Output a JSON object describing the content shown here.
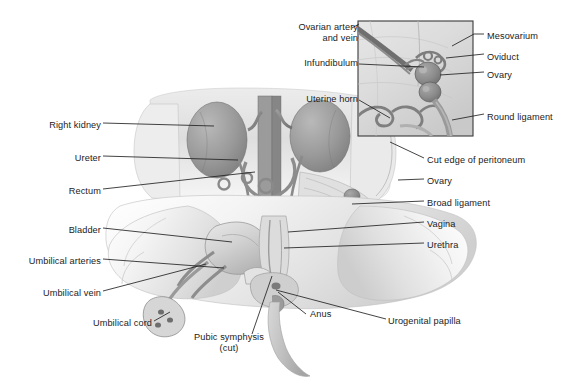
{
  "figure": {
    "background_color": "#ffffff",
    "text_color": "#1b1b1b",
    "leader_line_color": "#222222"
  },
  "inset": {
    "name": "ovary-detail-inset",
    "border_color": "#3a3a3a",
    "x": 358,
    "y": 21,
    "width": 115,
    "height": 115,
    "labels_left": [
      {
        "id": "ovarian-artery-and-vein",
        "line1": "Ovarian artery",
        "line2": "and vein",
        "x": 288,
        "y": 22,
        "width": 70
      },
      {
        "id": "infundibulum",
        "text": "Infundibulum",
        "x": 283,
        "y": 58,
        "width": 75
      },
      {
        "id": "uterine-horn",
        "text": "Uterine horn",
        "x": 287,
        "y": 94,
        "width": 71
      }
    ],
    "labels_right": [
      {
        "id": "mesovarium",
        "text": "Mesovarium",
        "x": 487,
        "y": 31
      },
      {
        "id": "oviduct",
        "text": "Oviduct",
        "x": 487,
        "y": 52
      },
      {
        "id": "ovary-inset",
        "text": "Ovary",
        "x": 487,
        "y": 70
      },
      {
        "id": "round-ligament",
        "text": "Round ligament",
        "x": 487,
        "y": 112
      }
    ]
  },
  "labels_left": [
    {
      "id": "right-kidney",
      "text": "Right kidney",
      "x": 35,
      "y": 120,
      "width": 66
    },
    {
      "id": "ureter",
      "text": "Ureter",
      "x": 60,
      "y": 153,
      "width": 41
    },
    {
      "id": "rectum",
      "text": "Rectum",
      "x": 56,
      "y": 186,
      "width": 45
    },
    {
      "id": "bladder",
      "text": "Bladder",
      "x": 57,
      "y": 225,
      "width": 44
    },
    {
      "id": "umbilical-arteries",
      "text": "Umbilical arteries",
      "x": 13,
      "y": 256,
      "width": 88
    },
    {
      "id": "umbilical-vein",
      "text": "Umbilical vein",
      "x": 28,
      "y": 288,
      "width": 73
    },
    {
      "id": "umbilical-cord",
      "text": "Umbilical cord",
      "x": 78,
      "y": 318,
      "width": 74
    }
  ],
  "labels_right": [
    {
      "id": "cut-edge-of-peritoneum",
      "text": "Cut edge of peritoneum",
      "x": 427,
      "y": 155
    },
    {
      "id": "ovary-main",
      "text": "Ovary",
      "x": 427,
      "y": 176
    },
    {
      "id": "broad-ligament",
      "text": "Broad ligament",
      "x": 427,
      "y": 198
    },
    {
      "id": "vagina",
      "text": "Vagina",
      "x": 427,
      "y": 219
    },
    {
      "id": "urethra",
      "text": "Urethra",
      "x": 427,
      "y": 240
    },
    {
      "id": "urogenital-papilla",
      "text": "Urogenital papilla",
      "x": 388,
      "y": 316
    }
  ],
  "labels_bottom": [
    {
      "id": "pubic-symphysis",
      "line1": "Pubic symphysis",
      "line2": "(cut)",
      "x": 186,
      "y": 338,
      "width": 86
    },
    {
      "id": "anus",
      "text": "Anus",
      "x": 310,
      "y": 312,
      "width": 30
    }
  ]
}
